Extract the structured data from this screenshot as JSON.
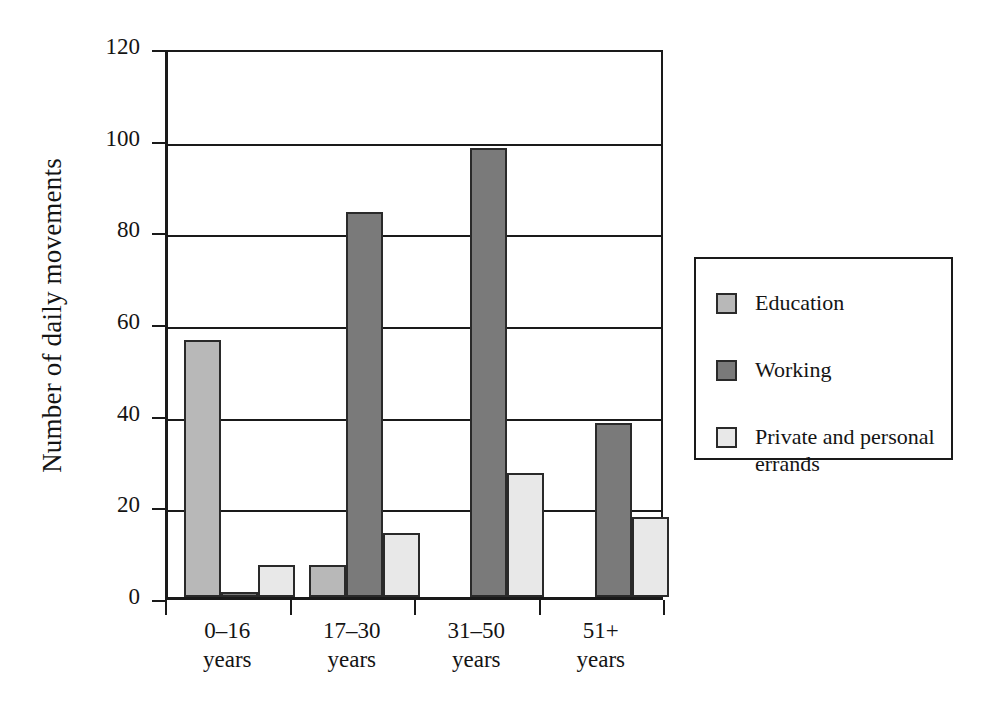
{
  "chart_data": {
    "type": "bar",
    "title": "",
    "xlabel": "",
    "ylabel": "Number of daily movements",
    "ylim": [
      0,
      120
    ],
    "yticks": [
      0,
      20,
      40,
      60,
      80,
      100,
      120
    ],
    "grid": true,
    "legend_position": "right",
    "categories": [
      "0–16\nyears",
      "17–30\nyears",
      "31–50\nyears",
      "51+\nyears"
    ],
    "category_labels_flat": [
      "0–16 years",
      "17–30 years",
      "31–50 years",
      "51+ years"
    ],
    "series": [
      {
        "name": "Education",
        "color": "#b8b8b8",
        "values": [
          56,
          7,
          0,
          0
        ]
      },
      {
        "name": "Working",
        "color": "#7a7a7a",
        "values": [
          1,
          84,
          98,
          38
        ]
      },
      {
        "name": "Private and personal\nerrands",
        "color": "#e8e8e8",
        "values": [
          7,
          14,
          27,
          17.5
        ]
      }
    ]
  },
  "axis": {
    "y_title": "Number of daily movements",
    "y_tick_labels": [
      "120",
      "100",
      "80",
      "60",
      "40",
      "20",
      "0"
    ],
    "x_tick_labels": [
      "0–16\nyears",
      "17–30\nyears",
      "31–50\nyears",
      "51+\nyears"
    ]
  },
  "legend": {
    "items": [
      {
        "label": "Education",
        "color": "#b8b8b8"
      },
      {
        "label": "Working",
        "color": "#7a7a7a"
      },
      {
        "label": "Private and personal\nerrands",
        "color": "#e8e8e8"
      }
    ]
  },
  "colors": {
    "education": "#b8b8b8",
    "working": "#7a7a7a",
    "private": "#e8e8e8",
    "axis": "#1a1a1a",
    "background": "#ffffff"
  }
}
